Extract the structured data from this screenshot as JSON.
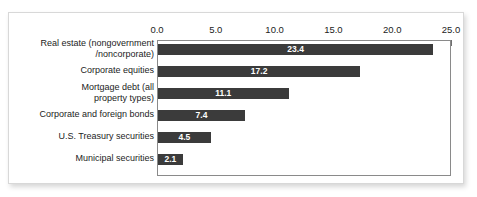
{
  "figure": {
    "frame_color": "#8a8a8a",
    "bar_color": "#3b3b3b",
    "value_label_color": "#ffffff",
    "background": "#ffffff"
  },
  "chart_data": {
    "type": "bar",
    "orientation": "horizontal",
    "title": "",
    "subtitle": "",
    "xlabel": "",
    "ylabel": "",
    "xlim": [
      0.0,
      25.0
    ],
    "grid": false,
    "legend": false,
    "axis_position": "top",
    "tick_labels": [
      "0.0",
      "5.0",
      "10.0",
      "15.0",
      "20.0",
      "25.0"
    ],
    "ticks": [
      0.0,
      5.0,
      10.0,
      15.0,
      20.0,
      25.0
    ],
    "categories": [
      "Real estate (nongovernment\n/noncorporate)",
      "Corporate equities",
      "Mortgage debt (all\nproperty types)",
      "Corporate and foreign bonds",
      "U.S. Treasury securities",
      "Municipal securities"
    ],
    "values": [
      23.4,
      17.2,
      11.1,
      7.4,
      4.5,
      2.1
    ],
    "value_labels": [
      "23.4",
      "17.2",
      "11.1",
      "7.4",
      "4.5",
      "2.1"
    ]
  }
}
